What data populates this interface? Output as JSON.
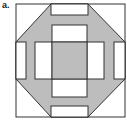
{
  "figure": {
    "label": "a.",
    "colors": {
      "fill": "#bdbdbd",
      "stroke": "#333333",
      "background": "#ffffff"
    }
  }
}
